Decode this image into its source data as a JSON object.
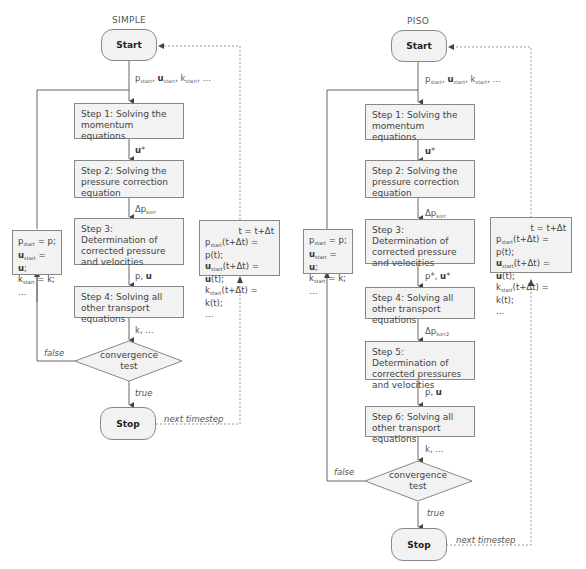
{
  "simple": {
    "title": "SIMPLE",
    "start": "Start",
    "stop": "Stop",
    "init_label": [
      "p",
      "start",
      "u",
      "start",
      "k",
      "start",
      ", …"
    ],
    "steps": [
      "Step 1: Solving the momentum equations",
      "Step 2: Solving the pressure correction equation",
      "Step 3: Determination of corrected pressure and velocities",
      "Step 4: Solving all other transport equations"
    ],
    "arrows": [
      "u*",
      "Δp",
      "korr",
      "p, ",
      "u",
      "k, …"
    ],
    "decision": [
      "convergence",
      "test"
    ],
    "false_label": "false",
    "true_label": "true",
    "next_label": "next timestep",
    "reset_box": {
      "lines": [
        "p_start = p;",
        "u_start = u;",
        "k_start = k;",
        "…"
      ]
    },
    "time_box": {
      "lines": [
        "t = t+Δt",
        "p_start(t+Δt) = p(t);",
        "u_start(t+Δt) = u(t);",
        "k_start(t+Δt) = k(t);",
        "…"
      ]
    }
  },
  "piso": {
    "title": "PISO",
    "start": "Start",
    "stop": "Stop",
    "steps": [
      "Step 1: Solving the momentum equations",
      "Step 2: Solving the pressure correction equation",
      "Step 3: Determination of corrected pressure and velocities",
      "Step 4: Solving all other transport equations",
      "Step 5: Determination of corrected pressures and velocities",
      "Step 6: Solving all other transport equations"
    ],
    "arrows": [
      "u*",
      "Δp korr",
      "p*, u*",
      "Δp korr2",
      "p, u",
      "k, …"
    ],
    "decision": [
      "convergence",
      "test"
    ],
    "false_label": "false",
    "true_label": "true",
    "next_label": "next timestep"
  },
  "common": {
    "dots": "…",
    "eq": " = ",
    "sub_start": "start",
    "sub_korr": "korr",
    "sub_korr2": "korr2",
    "t_eq": "t = t+Δt",
    "tdt": "(t+Δt) = ",
    "p_t": "p(t);",
    "u_t": "(t);",
    "k_t": "k(t);",
    "p": "p",
    "u": "u",
    "k": "k",
    "p_semi": "p;",
    "u_semi": ";",
    "k_semi": "k;",
    "delta_p": "Δp",
    "comma": ", ",
    "star": "*",
    "p_star": "p*, ",
    "k_dots": "k, …"
  }
}
